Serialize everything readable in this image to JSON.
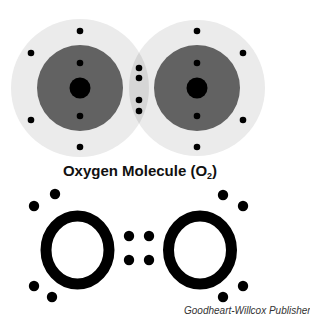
{
  "diagram": {
    "title": "Oxygen Molecule (O",
    "title_subscript": "2",
    "title_suffix": ")",
    "lewis_left_symbol": "O",
    "lewis_right_symbol": "O",
    "credit": "Goodheart-Willcox Publisher",
    "colors": {
      "outer_shell": "#ebebeb",
      "overlap": "#d6d6d6",
      "inner_shell": "#626262",
      "nucleus": "#000000",
      "electron": "#000000"
    },
    "atoms": [
      {
        "cx": 80,
        "cy": 88
      },
      {
        "cx": 197,
        "cy": 88
      }
    ],
    "shared_electrons": 4,
    "lewis_lone_pairs_per_atom": 2,
    "lewis_shared_pairs": 2
  }
}
